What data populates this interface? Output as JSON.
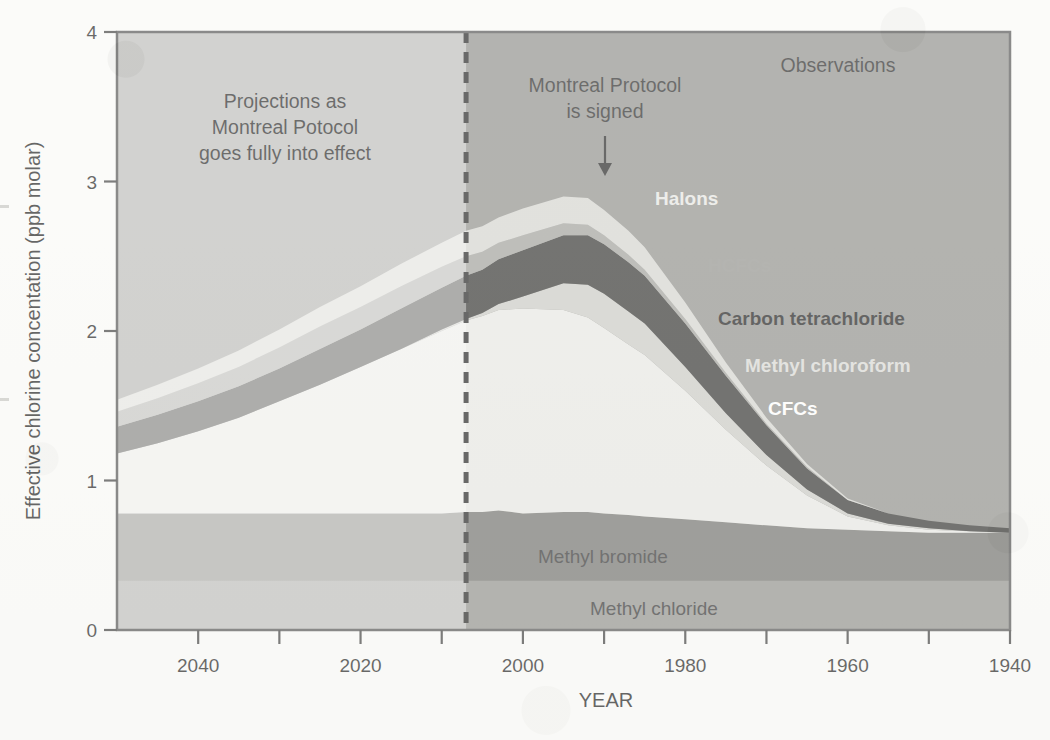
{
  "figure": {
    "background_color": "#fbfbf9",
    "plot_border_color": "#4a4a4a"
  },
  "axes": {
    "y_axis_title": "Effective chlorine concentation (ppb molar)",
    "x_axis_title": "YEAR",
    "y_ticks": [
      "0",
      "1",
      "2",
      "3",
      "4"
    ],
    "x_ticks": [
      "2040",
      "2020",
      "2000",
      "1980",
      "1960",
      "1940"
    ],
    "y_min": 0,
    "y_max": 4,
    "x_left_year": 2050,
    "x_right_year": 1940,
    "x_reversed": true
  },
  "annotations": {
    "projection_note": "Projections as\nMontreal Potocol\ngoes fully into effect",
    "projection_line_1": "Projections as",
    "projection_line_2": "Montreal Potocol",
    "projection_line_3": "goes fully into effect",
    "signing_line_1": "Montreal Protocol",
    "signing_line_2": "is signed",
    "signing_year": 1987,
    "observations_label": "Observations",
    "divider_year": 2007,
    "divider_style": "dashed"
  },
  "chart_data": {
    "type": "area",
    "title": "",
    "xlabel": "YEAR",
    "ylabel": "Effective chlorine concentation (ppb molar)",
    "xlim": [
      2050,
      1940
    ],
    "ylim": [
      0,
      4
    ],
    "grid": false,
    "stacked": true,
    "legend": "inline-labels",
    "x": [
      1940,
      1945,
      1950,
      1955,
      1960,
      1965,
      1970,
      1975,
      1980,
      1985,
      1987,
      1990,
      1992,
      1995,
      2000,
      2003,
      2005,
      2007,
      2010,
      2015,
      2020,
      2025,
      2030,
      2035,
      2040,
      2045,
      2050
    ],
    "series": [
      {
        "name": "Methyl chloride",
        "color": "#8e8e8a",
        "label_color": "#2a2a2a",
        "values": [
          0.33,
          0.33,
          0.33,
          0.33,
          0.33,
          0.33,
          0.33,
          0.33,
          0.33,
          0.33,
          0.33,
          0.33,
          0.33,
          0.33,
          0.33,
          0.33,
          0.33,
          0.33,
          0.33,
          0.33,
          0.33,
          0.33,
          0.33,
          0.33,
          0.33,
          0.33,
          0.33
        ]
      },
      {
        "name": "Methyl bromide",
        "color": "#6e6e6a",
        "label_color": "#2a2a2a",
        "values": [
          0.32,
          0.32,
          0.32,
          0.33,
          0.34,
          0.35,
          0.37,
          0.39,
          0.41,
          0.43,
          0.44,
          0.45,
          0.46,
          0.46,
          0.45,
          0.47,
          0.46,
          0.46,
          0.45,
          0.45,
          0.45,
          0.45,
          0.45,
          0.45,
          0.45,
          0.45,
          0.45
        ]
      },
      {
        "name": "CFCs",
        "color": "#e8e8e4",
        "label_color": "#ffffff",
        "values": [
          0.0,
          0.01,
          0.02,
          0.04,
          0.09,
          0.22,
          0.4,
          0.62,
          0.86,
          1.08,
          1.14,
          1.24,
          1.3,
          1.35,
          1.37,
          1.34,
          1.31,
          1.28,
          1.22,
          1.1,
          0.98,
          0.86,
          0.75,
          0.64,
          0.55,
          0.47,
          0.4
        ]
      },
      {
        "name": "Methyl chloroform",
        "color": "#c9c9c4",
        "label_color": "#dedede",
        "values": [
          0.0,
          0.0,
          0.01,
          0.01,
          0.02,
          0.04,
          0.07,
          0.11,
          0.16,
          0.21,
          0.22,
          0.23,
          0.22,
          0.18,
          0.08,
          0.04,
          0.02,
          0.01,
          0.01,
          0.0,
          0.0,
          0.0,
          0.0,
          0.0,
          0.0,
          0.0,
          0.0
        ]
      },
      {
        "name": "Carbon tetrachloride",
        "color": "#2b2b29",
        "label_color": "#151515",
        "values": [
          0.03,
          0.04,
          0.05,
          0.07,
          0.09,
          0.14,
          0.2,
          0.25,
          0.29,
          0.32,
          0.33,
          0.33,
          0.33,
          0.32,
          0.31,
          0.3,
          0.29,
          0.29,
          0.28,
          0.27,
          0.25,
          0.24,
          0.22,
          0.21,
          0.2,
          0.19,
          0.18
        ]
      },
      {
        "name": "HCFCs",
        "color": "#9e9e99",
        "label_color": "#8d8d88",
        "values": [
          0.0,
          0.0,
          0.0,
          0.0,
          0.0,
          0.01,
          0.01,
          0.02,
          0.03,
          0.04,
          0.05,
          0.06,
          0.07,
          0.08,
          0.1,
          0.11,
          0.12,
          0.13,
          0.14,
          0.15,
          0.15,
          0.15,
          0.14,
          0.13,
          0.12,
          0.11,
          0.1
        ]
      },
      {
        "name": "Halons",
        "color": "#d4d4cf",
        "label_color": "#e4e4e0",
        "values": [
          0.0,
          0.0,
          0.0,
          0.0,
          0.01,
          0.02,
          0.04,
          0.07,
          0.11,
          0.15,
          0.16,
          0.17,
          0.18,
          0.18,
          0.18,
          0.17,
          0.17,
          0.17,
          0.16,
          0.15,
          0.14,
          0.13,
          0.12,
          0.11,
          0.1,
          0.09,
          0.08
        ]
      }
    ],
    "totals_note": "Peak total near 3.15 ppb around 1992-1994; falls to about 0.65 ppb at 1940 and about 1.54 ppb at 2050 (projection).",
    "plot_background_color": "#8c8c88",
    "projection_fade_overlay": "rgba(255,255,255,0.42)"
  },
  "series_labels": [
    {
      "name": "Halons",
      "color": "#e6e6e2",
      "bold": true
    },
    {
      "name": "HCFCs",
      "color": "#8f8f8a",
      "bold": true
    },
    {
      "name": "Carbon tetrachloride",
      "color": "#141414",
      "bold": true
    },
    {
      "name": "Methyl chloroform",
      "color": "#d8d8d4",
      "bold": true
    },
    {
      "name": "CFCs",
      "color": "#ffffff",
      "bold": true
    },
    {
      "name": "Methyl bromide",
      "color": "#2b2b2b",
      "bold": false
    },
    {
      "name": "Methyl chloride",
      "color": "#2b2b2b",
      "bold": false
    }
  ]
}
